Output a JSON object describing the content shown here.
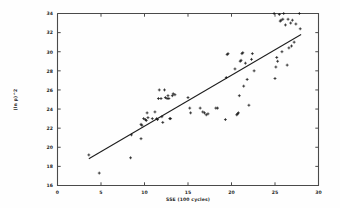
{
  "figure": {
    "kind": "scatter-plot-with-fit",
    "background_color": "#fefefe",
    "frame_color": "#4a4a4a",
    "marker_color": "#141414",
    "line_color": "#1d1d1d"
  },
  "chart_data": {
    "type": "scatter",
    "title": "",
    "subtitle": "",
    "xlabel": "SSE (100 cycles)",
    "ylabel": "(ln p)^2",
    "xlim": [
      0,
      30
    ],
    "ylim": [
      16,
      34
    ],
    "xticks": [
      0,
      5,
      10,
      15,
      20,
      25,
      30
    ],
    "xtick_labels": [
      "0",
      "5",
      "10",
      "15",
      "20",
      "25",
      "30"
    ],
    "yticks": [
      16,
      18,
      20,
      22,
      24,
      26,
      28,
      30,
      32,
      34
    ],
    "ytick_labels": [
      "16",
      "18",
      "20",
      "22",
      "24",
      "26",
      "28",
      "30",
      "32",
      "34"
    ],
    "grid": false,
    "legend": null,
    "legend_position": "none",
    "marker": "plus",
    "annotations": [],
    "fit_line": {
      "name": "linear fit",
      "x": [
        3.6,
        28.0
      ],
      "y": [
        18.8,
        31.8
      ],
      "slope": 0.533,
      "intercept": 16.88
    },
    "series": [
      {
        "name": "observations",
        "points": [
          [
            3.6,
            19.2
          ],
          [
            4.8,
            17.3
          ],
          [
            8.4,
            18.9
          ],
          [
            8.5,
            21.3
          ],
          [
            9.6,
            22.4
          ],
          [
            9.7,
            22.3
          ],
          [
            9.6,
            20.9
          ],
          [
            9.9,
            23.0
          ],
          [
            10.1,
            22.9
          ],
          [
            10.2,
            22.8
          ],
          [
            10.4,
            23.1
          ],
          [
            10.3,
            23.6
          ],
          [
            10.9,
            23.0
          ],
          [
            11.2,
            23.7
          ],
          [
            11.4,
            23.0
          ],
          [
            11.5,
            22.9
          ],
          [
            11.6,
            25.1
          ],
          [
            11.7,
            26.0
          ],
          [
            11.9,
            25.1
          ],
          [
            12.0,
            23.2
          ],
          [
            12.1,
            22.6
          ],
          [
            12.3,
            26.0
          ],
          [
            12.4,
            25.2
          ],
          [
            12.6,
            25.1
          ],
          [
            12.7,
            25.4
          ],
          [
            12.8,
            25.1
          ],
          [
            12.9,
            23.0
          ],
          [
            13.0,
            23.0
          ],
          [
            13.2,
            25.4
          ],
          [
            13.3,
            25.6
          ],
          [
            13.5,
            25.5
          ],
          [
            15.0,
            25.2
          ],
          [
            15.2,
            24.1
          ],
          [
            15.3,
            23.6
          ],
          [
            16.4,
            24.1
          ],
          [
            16.7,
            23.7
          ],
          [
            16.9,
            23.6
          ],
          [
            17.1,
            23.4
          ],
          [
            17.3,
            23.5
          ],
          [
            18.2,
            24.1
          ],
          [
            18.4,
            24.1
          ],
          [
            19.3,
            22.9
          ],
          [
            19.4,
            27.3
          ],
          [
            19.5,
            29.7
          ],
          [
            19.6,
            29.8
          ],
          [
            20.4,
            28.2
          ],
          [
            20.6,
            23.4
          ],
          [
            20.7,
            23.5
          ],
          [
            20.8,
            23.6
          ],
          [
            20.9,
            25.4
          ],
          [
            21.0,
            29.0
          ],
          [
            21.1,
            29.1
          ],
          [
            21.2,
            29.8
          ],
          [
            21.3,
            29.9
          ],
          [
            21.4,
            26.4
          ],
          [
            21.6,
            28.8
          ],
          [
            21.8,
            27.1
          ],
          [
            22.0,
            24.4
          ],
          [
            22.3,
            29.2
          ],
          [
            22.4,
            29.8
          ],
          [
            22.6,
            28.0
          ],
          [
            24.9,
            34.0
          ],
          [
            25.0,
            27.2
          ],
          [
            25.1,
            28.4
          ],
          [
            25.2,
            29.4
          ],
          [
            25.3,
            29.0
          ],
          [
            25.5,
            33.9
          ],
          [
            25.6,
            33.2
          ],
          [
            25.7,
            33.3
          ],
          [
            25.8,
            30.0
          ],
          [
            25.9,
            33.4
          ],
          [
            26.0,
            34.0
          ],
          [
            26.2,
            32.8
          ],
          [
            26.4,
            28.6
          ],
          [
            26.5,
            33.4
          ],
          [
            26.6,
            30.4
          ],
          [
            26.8,
            33.0
          ],
          [
            26.9,
            30.6
          ],
          [
            27.0,
            33.3
          ],
          [
            27.2,
            31.0
          ],
          [
            27.4,
            32.9
          ],
          [
            27.8,
            34.0
          ],
          [
            27.9,
            32.4
          ]
        ]
      }
    ]
  }
}
